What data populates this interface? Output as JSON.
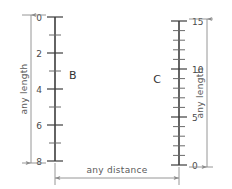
{
  "diagram": {
    "scales": [
      {
        "id": "B",
        "label": "B",
        "direction": "downward",
        "major_labels": [
          "0",
          "2",
          "4",
          "6",
          "8"
        ],
        "major_values": [
          0,
          2,
          4,
          6,
          8
        ],
        "minor_per_major": 2,
        "range": [
          0,
          8
        ],
        "dimension_label": "any length",
        "label_side": "left"
      },
      {
        "id": "C",
        "label": "C",
        "direction": "upward",
        "major_labels": [
          "15",
          "10",
          "5",
          "0"
        ],
        "major_values": [
          15,
          10,
          5,
          0
        ],
        "minor_per_major": 5,
        "range": [
          0,
          15
        ],
        "dimension_label": "any length",
        "label_side": "right"
      }
    ],
    "horizontal_dimension": {
      "label": "any distance"
    },
    "colors": {
      "rule": "#3d3d3d",
      "tick_minor": "#6a6a6a",
      "dimension": "#8a8a8a",
      "number_text": "#4a4a4a",
      "letter_text": "#333333",
      "dimension_text": "#5a5a5a",
      "background": "#ffffff"
    }
  }
}
